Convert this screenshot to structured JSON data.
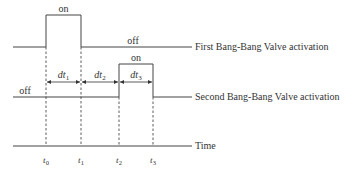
{
  "diagram": {
    "type": "timing",
    "signals": [
      {
        "name": "First Bang-Bang Valve activation",
        "high_label": "on",
        "low_label": "off",
        "on_interval": [
          "t0",
          "t1"
        ]
      },
      {
        "name": "Second Bang-Bang Valve activation",
        "high_label": "on",
        "low_label": "off",
        "on_interval": [
          "t2",
          "t3"
        ]
      }
    ],
    "axis_label": "Time",
    "ticks": [
      {
        "base": "t",
        "sub": "0"
      },
      {
        "base": "t",
        "sub": "1"
      },
      {
        "base": "t",
        "sub": "2"
      },
      {
        "base": "t",
        "sub": "3"
      }
    ],
    "intervals": [
      {
        "base": "dt",
        "sub": "1",
        "from": "t0",
        "to": "t1"
      },
      {
        "base": "dt",
        "sub": "2",
        "from": "t1",
        "to": "t2"
      },
      {
        "base": "dt",
        "sub": "3",
        "from": "t2",
        "to": "t3"
      }
    ]
  }
}
